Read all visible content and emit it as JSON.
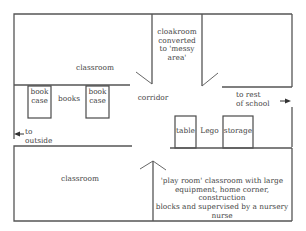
{
  "colors": {
    "wall": "#555555",
    "text": "#444444",
    "background": "#ffffff"
  },
  "rooms": {
    "classroom_top": "classroom",
    "cloakroom": "cloakroom\nconverted\nto 'messy\narea'",
    "corridor": "corridor",
    "classroom_bottom": "classroom",
    "play_room": "'play room' classroom with large\nequipment, home corner, construction\nblocks and supervised by a nursery\nnurse"
  },
  "furniture": {
    "bookcase_left": "book\ncase",
    "books": "books",
    "bookcase_right": "book\ncase",
    "table": "table",
    "lego": "Lego",
    "storage": "storage"
  },
  "directions": {
    "to_outside": "to\noutside",
    "to_rest_of_school": "to rest\nof school"
  }
}
